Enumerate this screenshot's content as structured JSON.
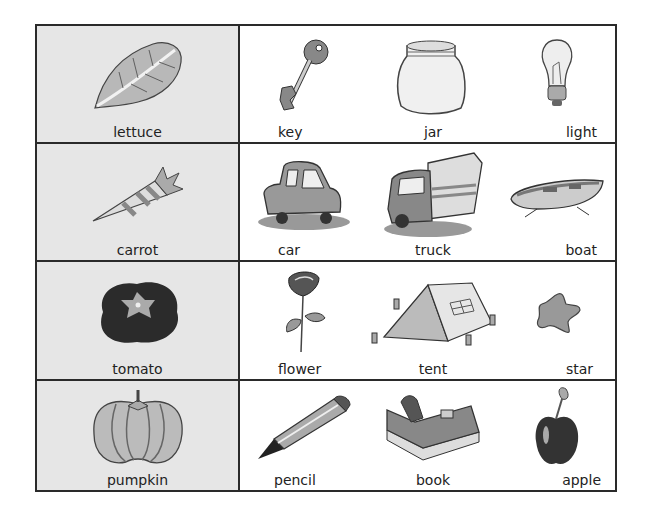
{
  "worksheet": {
    "rows": [
      {
        "target": {
          "word": "lettuce",
          "icon": "lettuce-icon"
        },
        "options": [
          {
            "word": "key",
            "icon": "key-icon"
          },
          {
            "word": "jar",
            "icon": "jar-icon"
          },
          {
            "word": "light",
            "icon": "light-bulb-icon"
          }
        ]
      },
      {
        "target": {
          "word": "carrot",
          "icon": "carrot-icon"
        },
        "options": [
          {
            "word": "car",
            "icon": "car-icon"
          },
          {
            "word": "truck",
            "icon": "truck-icon"
          },
          {
            "word": "boat",
            "icon": "boat-icon"
          }
        ]
      },
      {
        "target": {
          "word": "tomato",
          "icon": "tomato-icon"
        },
        "options": [
          {
            "word": "flower",
            "icon": "flower-icon"
          },
          {
            "word": "tent",
            "icon": "tent-icon"
          },
          {
            "word": "star",
            "icon": "star-icon"
          }
        ]
      },
      {
        "target": {
          "word": "pumpkin",
          "icon": "pumpkin-icon"
        },
        "options": [
          {
            "word": "pencil",
            "icon": "pencil-icon"
          },
          {
            "word": "book",
            "icon": "book-icon"
          },
          {
            "word": "apple",
            "icon": "apple-icon"
          }
        ]
      }
    ]
  },
  "colors": {
    "border": "#2a2a2a",
    "target_bg": "#e6e6e6",
    "options_bg": "#ffffff"
  }
}
